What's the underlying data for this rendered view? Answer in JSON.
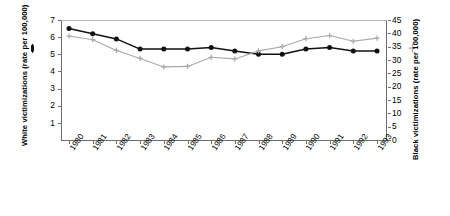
{
  "chart_data": {
    "type": "line",
    "title": "",
    "subtitle": "",
    "xlabel": "",
    "categories": [
      "1980",
      "1981",
      "1982",
      "1983",
      "1984",
      "1985",
      "1986",
      "1987",
      "1988",
      "1989",
      "1990",
      "1991",
      "1992",
      "1993"
    ],
    "grid": false,
    "legend_position": "axis-labels",
    "axes": {
      "left": {
        "label_line1": "White victimizations",
        "label_line2": "(rate per 100,000)",
        "ticks": [
          0,
          1,
          2,
          3,
          4,
          5,
          6,
          7
        ],
        "ylim": [
          0,
          7
        ],
        "marker": "filled-circle",
        "color": "#111111"
      },
      "right": {
        "label_line1": "Black victimizations",
        "label_line2": "(rate per 100,000)",
        "ticks": [
          0,
          5,
          10,
          15,
          20,
          25,
          30,
          35,
          40,
          45
        ],
        "ylim": [
          0,
          45
        ],
        "marker": "plus-cross",
        "color": "#a8a8a8"
      }
    },
    "series": [
      {
        "name": "White victimizations (rate per 100,000)",
        "axis": "left",
        "color": "#111111",
        "marker": "filled-circle",
        "values": [
          6.5,
          6.2,
          5.9,
          5.3,
          5.3,
          5.3,
          5.4,
          5.2,
          5.0,
          5.0,
          5.3,
          5.4,
          5.2,
          5.2
        ]
      },
      {
        "name": "Black victimizations (rate per 100,000)",
        "axis": "right",
        "color": "#a8a8a8",
        "marker": "plus-cross",
        "values": [
          39.0,
          37.6,
          33.6,
          30.6,
          27.4,
          27.6,
          31.0,
          30.4,
          33.4,
          35.0,
          38.0,
          39.2,
          37.0,
          38.2
        ]
      }
    ]
  },
  "left_axis": {
    "title_line1": "White victimizations",
    "title_line2": "(rate per 100,000)",
    "tick_labels": [
      "7",
      "6",
      "5",
      "4",
      "3",
      "2",
      "1"
    ]
  },
  "right_axis": {
    "title_line1": "Black victimizations",
    "title_line2": "(rate per 100,000)",
    "tick_labels": [
      "45",
      "40",
      "35",
      "30",
      "25",
      "20",
      "15",
      "10",
      "5",
      "0"
    ]
  },
  "x_axis": {
    "tick_labels": [
      "1980",
      "1981",
      "1982",
      "1983",
      "1984",
      "1985",
      "1986",
      "1987",
      "1988",
      "1989",
      "1990",
      "1991",
      "1992",
      "1993"
    ]
  }
}
